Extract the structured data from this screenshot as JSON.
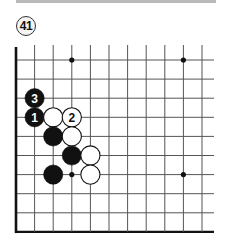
{
  "header": {
    "problem_number": "41"
  },
  "board": {
    "columns": 11,
    "rows": 10,
    "origin_x": 16,
    "origin_y": 60,
    "spacing_x": 18.6,
    "spacing_y": 19.1,
    "line_extend_right": 214,
    "line_extend_top": 45,
    "left_edge": true,
    "bottom_edge": true,
    "line_color": "#555555",
    "edge_color": "#111111",
    "star_points": [
      [
        3,
        0
      ],
      [
        9,
        0
      ],
      [
        3,
        6
      ],
      [
        9,
        6
      ]
    ],
    "stones": [
      {
        "col": 1,
        "row": 2,
        "color": "black",
        "label": "3"
      },
      {
        "col": 1,
        "row": 3,
        "color": "black",
        "label": "1"
      },
      {
        "col": 2,
        "row": 3,
        "color": "white",
        "label": ""
      },
      {
        "col": 3,
        "row": 3,
        "color": "white",
        "label": "2"
      },
      {
        "col": 2,
        "row": 4,
        "color": "black",
        "label": ""
      },
      {
        "col": 3,
        "row": 4,
        "color": "white",
        "label": ""
      },
      {
        "col": 3,
        "row": 5,
        "color": "black",
        "label": ""
      },
      {
        "col": 4,
        "row": 5,
        "color": "white",
        "label": ""
      },
      {
        "col": 2,
        "row": 6,
        "color": "black",
        "label": ""
      },
      {
        "col": 4,
        "row": 6,
        "color": "white",
        "label": ""
      }
    ]
  }
}
